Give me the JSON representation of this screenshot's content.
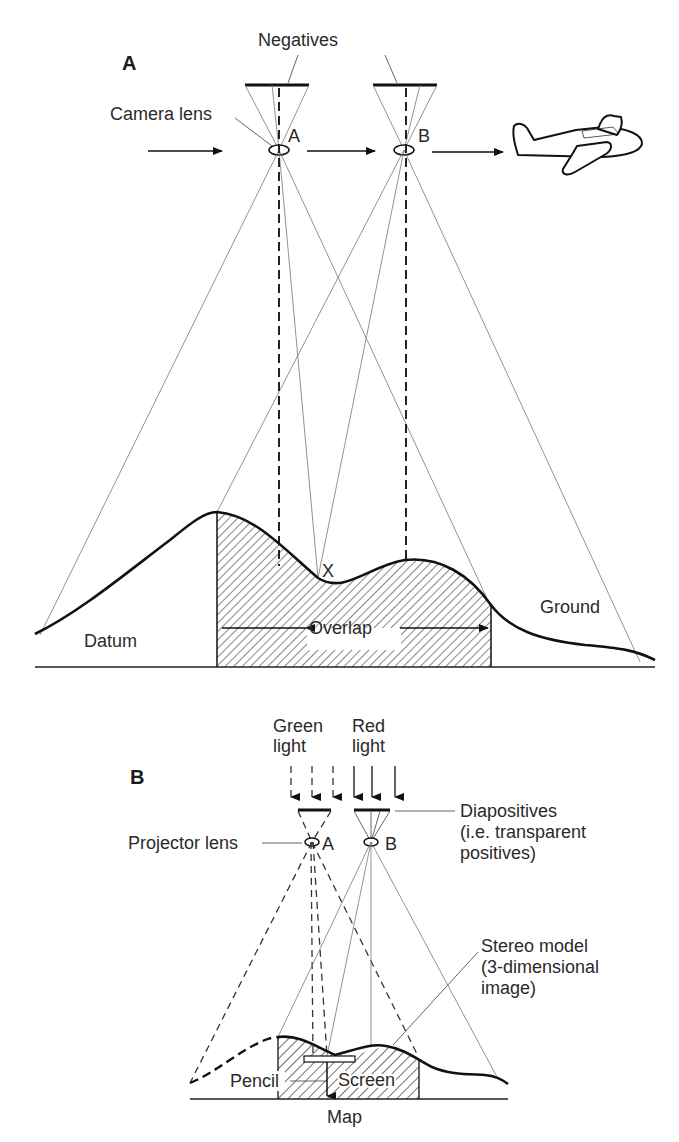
{
  "figure": {
    "panel_a": {
      "panel_label": "A",
      "labels": {
        "negatives": "Negatives",
        "camera_lens": "Camera lens",
        "station_a": "A",
        "station_b": "B",
        "point_x": "X",
        "overlap": "Overlap",
        "ground": "Ground",
        "datum": "Datum"
      },
      "icons": [
        "airplane-icon",
        "flight-direction-arrow-icon"
      ]
    },
    "panel_b": {
      "panel_label": "B",
      "labels": {
        "green_light_1": "Green",
        "green_light_2": "light",
        "red_light_1": "Red",
        "red_light_2": "light",
        "diapositives_1": "Diapositives",
        "diapositives_2": "(i.e. transparent",
        "diapositives_3": "positives)",
        "projector_lens": "Projector lens",
        "station_a": "A",
        "station_b": "B",
        "stereo_model_1": "Stereo model",
        "stereo_model_2": "(3-dimensional",
        "stereo_model_3": "image)",
        "pencil": "Pencil",
        "screen": "Screen",
        "map": "Map"
      }
    }
  }
}
